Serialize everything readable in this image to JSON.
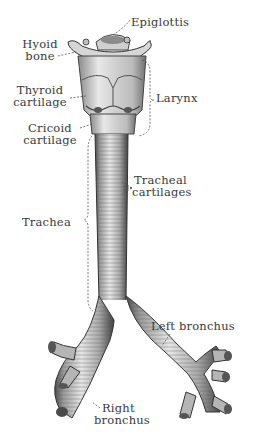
{
  "diagram": {
    "colors": {
      "background": "#ffffff",
      "ink": "#3a3a3a",
      "tissue_light": "#e8e8e8",
      "tissue_mid": "#b5b5b5",
      "tissue_dark": "#5a5a5a"
    },
    "labels": {
      "epiglottis": "Epiglottis",
      "hyoid_bone_line1": "Hyoid",
      "hyoid_bone_line2": "bone",
      "thyroid_line1": "Thyroid",
      "thyroid_line2": "cartilage",
      "larynx": "Larynx",
      "cricoid_line1": "Cricoid",
      "cricoid_line2": "cartilage",
      "tracheal_cart_line1": "Tracheal",
      "tracheal_cart_line2": "cartilages",
      "trachea": "Trachea",
      "left_bronchus": "Left bronchus",
      "right_bronchus_line1": "Right",
      "right_bronchus_line2": "bronchus"
    }
  }
}
